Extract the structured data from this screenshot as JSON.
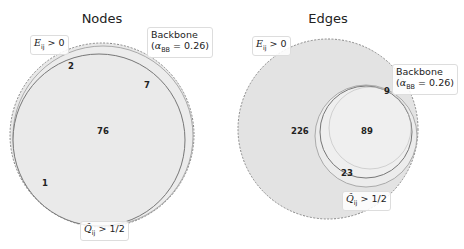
{
  "panels": [
    {
      "title": "Nodes",
      "labels": {
        "E": "E_ij > 0",
        "backbone_line1": "Backbone",
        "backbone_line2": "(α_BB = 0.26)",
        "Q": "Q̂_ij > 1/2"
      },
      "regions": {
        "E_only": "2",
        "backbone_only": "7",
        "all_three": "76",
        "E_and_Q_only": "1"
      }
    },
    {
      "title": "Edges",
      "labels": {
        "E": "E_ij > 0",
        "backbone_line1": "Backbone",
        "backbone_line2": "(α_BB = 0.26)",
        "Q": "Q̂_ij > 1/2"
      },
      "regions": {
        "E_only": "226",
        "backbone_only": "9",
        "all_three": "89",
        "E_and_Q_only": "23"
      }
    }
  ],
  "colors": {
    "fill": "#e6e6e6",
    "stroke": "#777777"
  }
}
